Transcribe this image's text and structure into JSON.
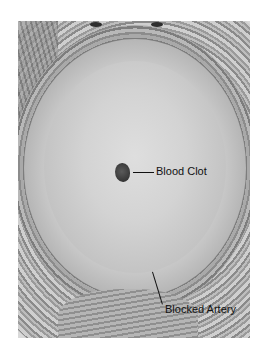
{
  "image": {
    "subject": "Cross-section micrograph of a blocked artery with a blood clot",
    "style": "grayscale histology"
  },
  "annotations": [
    {
      "label": "Blood Clot"
    },
    {
      "label": "Blocked Artery"
    }
  ]
}
